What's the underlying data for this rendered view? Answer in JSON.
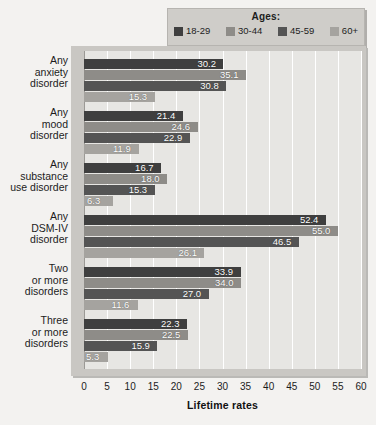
{
  "legend": {
    "title": "Ages:",
    "items": [
      {
        "label": "18-29",
        "color": "#3f3f3f",
        "icon": "legend-swatch-icon"
      },
      {
        "label": "30-44",
        "color": "#8e8c88",
        "icon": "legend-swatch-icon"
      },
      {
        "label": "45-59",
        "color": "#545454",
        "icon": "legend-swatch-icon"
      },
      {
        "label": "60+",
        "color": "#a5a39f",
        "icon": "legend-swatch-icon"
      }
    ]
  },
  "chart_data": {
    "type": "bar",
    "orientation": "horizontal",
    "title": "",
    "xlabel": "Lifetime rates",
    "ylabel": "",
    "xlim": [
      0,
      60
    ],
    "xticks": [
      0,
      5,
      10,
      15,
      20,
      25,
      30,
      35,
      40,
      45,
      50,
      55,
      60
    ],
    "grid": true,
    "legend_position": "top-right",
    "categories": [
      "Any\nanxiety\ndisorder",
      "Any\nmood\ndisorder",
      "Any\nsubstance\nuse disorder",
      "Any\nDSM-IV\ndisorder",
      "Two\nor more\ndisorders",
      "Three\nor more\ndisorders"
    ],
    "category_lines": [
      [
        "Any",
        "anxiety",
        "disorder"
      ],
      [
        "Any",
        "mood",
        "disorder"
      ],
      [
        "Any",
        "substance",
        "use disorder"
      ],
      [
        "Any",
        "DSM-IV",
        "disorder"
      ],
      [
        "Two",
        "or more",
        "disorders"
      ],
      [
        "Three",
        "or more",
        "disorders"
      ]
    ],
    "series": [
      {
        "name": "18-29",
        "color": "#3f3f3f",
        "values": [
          30.2,
          21.4,
          16.7,
          52.4,
          33.9,
          22.3
        ]
      },
      {
        "name": "30-44",
        "color": "#8e8c88",
        "values": [
          35.1,
          24.6,
          18.0,
          55.0,
          34.0,
          22.5
        ]
      },
      {
        "name": "45-59",
        "color": "#545454",
        "values": [
          30.8,
          22.9,
          15.3,
          46.5,
          27.0,
          15.9
        ]
      },
      {
        "name": "60+",
        "color": "#a5a39f",
        "values": [
          15.3,
          11.9,
          6.3,
          26.1,
          11.6,
          5.3
        ]
      }
    ],
    "value_labels": [
      [
        "30.2",
        "35.1",
        "30.8",
        "15.3"
      ],
      [
        "21.4",
        "24.6",
        "22.9",
        "11.9"
      ],
      [
        "16.7",
        "18.0",
        "15.3",
        "6.3"
      ],
      [
        "52.4",
        "55.0",
        "46.5",
        "26.1"
      ],
      [
        "33.9",
        "34.0",
        "27.0",
        "11.6"
      ],
      [
        "22.3",
        "22.5",
        "15.9",
        "5.3"
      ]
    ]
  }
}
